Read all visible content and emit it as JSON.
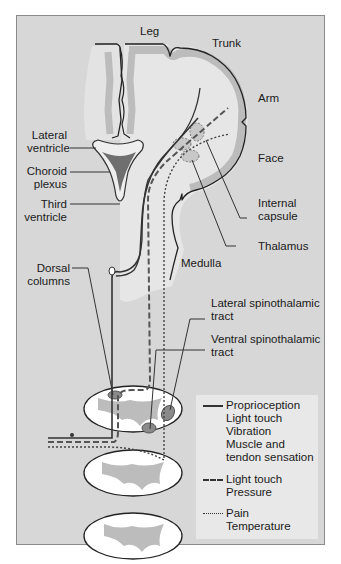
{
  "figure": {
    "type": "neuroanatomy-diagram"
  },
  "labels": {
    "leg": "Leg",
    "trunk": "Trunk",
    "arm": "Arm",
    "face": "Face",
    "lateral_ventricle": [
      "Lateral",
      "ventricle"
    ],
    "choroid_plexus": [
      "Choroid",
      "plexus"
    ],
    "third_ventricle": [
      "Third",
      "ventricle"
    ],
    "internal_capsule": [
      "Internal",
      "capsule"
    ],
    "thalamus": "Thalamus",
    "medulla": "Medulla",
    "dorsal_columns": [
      "Dorsal",
      "columns"
    ],
    "lateral_spinothalamic": [
      "Lateral spinothalamic",
      "tract"
    ],
    "ventral_spinothalamic": [
      "Ventral spinothalamic",
      "tract"
    ]
  },
  "legend": {
    "items": [
      {
        "line_style": "solid",
        "lines": [
          "Proprioception",
          "Light touch",
          "Vibration",
          "Muscle and",
          "tendon sensation"
        ]
      },
      {
        "line_style": "dashed",
        "lines": [
          "Light touch",
          "Pressure"
        ]
      },
      {
        "line_style": "dotted",
        "lines": [
          "Pain",
          "Temperature"
        ]
      }
    ]
  },
  "colors": {
    "background": "#d7d7d7",
    "white_matter": "#e6e6e6",
    "gray_matter": "#bcbcbc",
    "choroid_plexus": "#6f6f6f",
    "tract_nucleus": "#8a8a8a",
    "outline": "#2a2a2a",
    "cord_section": "#ffffff",
    "legend_bg": "#e8e8e8"
  }
}
